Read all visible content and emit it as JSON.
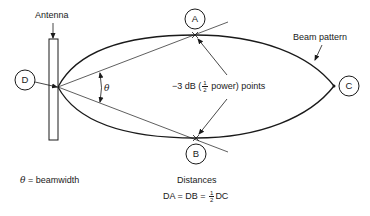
{
  "labels": {
    "antenna": "Antenna",
    "beam_pattern": "Beam pattern",
    "half_power_prefix": "−3 dB (",
    "half_power_frac_num": "1",
    "half_power_frac_den": "2",
    "half_power_suffix": " power) points",
    "theta_symbol": "θ",
    "theta_legend_symbol": "θ",
    "theta_legend_text": " = beamwidth",
    "distances_title": "Distances",
    "distances_eq_prefix": "DA = DB = ",
    "distances_frac_num": "1",
    "distances_frac_den": "2",
    "distances_eq_suffix": "DC"
  },
  "points": {
    "A": "A",
    "B": "B",
    "C": "C",
    "D": "D"
  },
  "colors": {
    "stroke": "#1a1a1a",
    "background": "#ffffff"
  }
}
